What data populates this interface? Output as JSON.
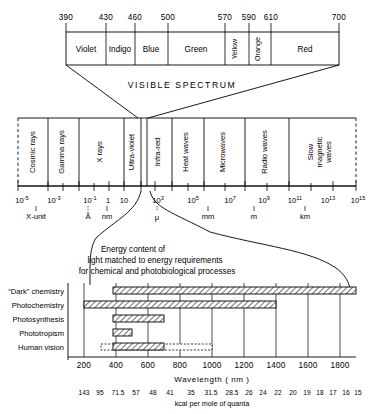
{
  "figure": {
    "background": "#ffffff",
    "line_color": "#000000"
  },
  "visible_spectrum": {
    "caption": "VISIBLE SPECTRUM",
    "tick_labels": [
      "390",
      "430",
      "460",
      "500",
      "570",
      "590",
      "610",
      "700"
    ],
    "tick_values": [
      390,
      430,
      460,
      500,
      570,
      590,
      610,
      700
    ],
    "bands": [
      {
        "label": "Violet",
        "from": 390,
        "to": 430,
        "orientation": "horizontal"
      },
      {
        "label": "Indigo",
        "from": 430,
        "to": 460,
        "orientation": "horizontal"
      },
      {
        "label": "Blue",
        "from": 460,
        "to": 500,
        "orientation": "horizontal"
      },
      {
        "label": "Green",
        "from": 500,
        "to": 570,
        "orientation": "horizontal"
      },
      {
        "label": "Yellow",
        "from": 570,
        "to": 590,
        "orientation": "vertical"
      },
      {
        "label": "Orange",
        "from": 590,
        "to": 610,
        "orientation": "vertical"
      },
      {
        "label": "Red",
        "from": 610,
        "to": 700,
        "orientation": "horizontal"
      }
    ]
  },
  "em_spectrum": {
    "bands": [
      {
        "label": "Cosmic rays"
      },
      {
        "label": "Gamma rays"
      },
      {
        "label": "X rays"
      },
      {
        "label": "Ultra-violet"
      },
      {
        "label": "Infra-red"
      },
      {
        "label": "Heat waves"
      },
      {
        "label": "Microwaves"
      },
      {
        "label": "Radio waves"
      },
      {
        "label": "Slow magnetic waves",
        "lines": [
          "Slow",
          "magnetic",
          "waves"
        ]
      }
    ],
    "exponent_labels": [
      {
        "base": "10",
        "exp": "-5"
      },
      {
        "base": "10",
        "exp": "-3"
      },
      {
        "base": "10",
        "exp": "-1"
      },
      {
        "base": "1",
        "exp": ""
      },
      {
        "base": "10",
        "exp": ""
      },
      {
        "base": "10",
        "exp": "3"
      },
      {
        "base": "10",
        "exp": "5"
      },
      {
        "base": "10",
        "exp": "7"
      },
      {
        "base": "10",
        "exp": "9"
      },
      {
        "base": "10",
        "exp": "11"
      },
      {
        "base": "10",
        "exp": "13"
      },
      {
        "base": "10",
        "exp": "15"
      }
    ],
    "unit_markers": [
      {
        "label": "X-unit"
      },
      {
        "label": "Å"
      },
      {
        "label": "nm"
      },
      {
        "label": "μ"
      },
      {
        "label": "mm"
      },
      {
        "label": "m"
      },
      {
        "label": "km"
      }
    ]
  },
  "callout": {
    "lines": [
      "Energy content of",
      "light matched to energy requirements",
      "for chemical and photobiological processes"
    ]
  },
  "processes": {
    "rows": [
      {
        "label": "“Dark” chemistry",
        "start": 380,
        "end": 1900,
        "style": "hatched"
      },
      {
        "label": "Photochemistry",
        "start": 200,
        "end": 1300,
        "style": "hatched"
      },
      {
        "label": "Photosynthesis",
        "start": 380,
        "end": 700,
        "style": "hatched"
      },
      {
        "label": "Phototropism",
        "start": 380,
        "end": 500,
        "style": "hatched"
      },
      {
        "label": "Human vision",
        "start": 380,
        "end": 700,
        "style": "hatched",
        "dotted_start": 310,
        "dotted_end": 1060
      }
    ],
    "axis": {
      "label": "Wavelength ( nm )",
      "tick_labels": [
        "200",
        "400",
        "600",
        "800",
        "1000",
        "1200",
        "1400",
        "1600",
        "1800"
      ],
      "tick_values": [
        200,
        400,
        600,
        800,
        1000,
        1200,
        1400,
        1600,
        1800
      ],
      "min": 170,
      "max": 1920
    },
    "energy_axis": {
      "label": "kcal per mole of quanta",
      "values": [
        "143",
        "95",
        "71.5",
        "57",
        "48",
        "41",
        "35",
        "31.5",
        "28.5",
        "26",
        "24",
        "22",
        "20",
        "19",
        "18",
        "17",
        "16",
        "15"
      ],
      "at_wavelength": [
        200,
        300,
        400,
        500,
        600,
        700,
        800,
        900,
        1000,
        1100,
        1200,
        1300,
        1400,
        1500,
        1600,
        1700,
        1800,
        1900
      ]
    }
  }
}
